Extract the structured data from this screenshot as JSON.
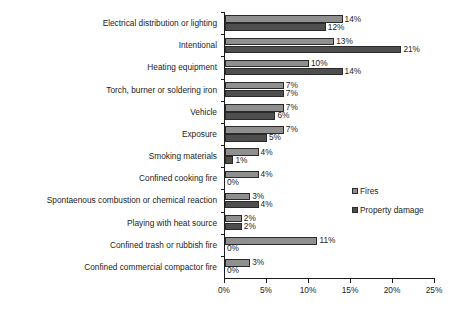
{
  "chart_data": {
    "type": "bar",
    "orientation": "horizontal",
    "title": "",
    "xlabel": "",
    "ylabel": "",
    "xlim": [
      0,
      25
    ],
    "xtick_labels": [
      "0%",
      "5%",
      "10%",
      "15%",
      "20%",
      "25%"
    ],
    "xticks": [
      0,
      5,
      10,
      15,
      20,
      25
    ],
    "grid": false,
    "legend_position": "right-middle",
    "categories": [
      "Electrical distribution or lighting",
      "Intentional",
      "Heating equipment",
      "Torch, burner or soldering iron",
      "Vehicle",
      "Exposure",
      "Smoking materials",
      "Confined cooking fire",
      "Spontaenous combustion or chemical reaction",
      "Playing with heat source",
      "Confined trash or rubbish fire",
      "Confined commercial compactor fire"
    ],
    "series": [
      {
        "name": "Fires",
        "color": "#8f8f8f",
        "values": [
          14,
          13,
          10,
          7,
          7,
          7,
          4,
          4,
          3,
          2,
          11,
          3
        ],
        "labels": [
          "14%",
          "13%",
          "10%",
          "7%",
          "7%",
          "7%",
          "4%",
          "4%",
          "3%",
          "2%",
          "11%",
          "3%"
        ]
      },
      {
        "name": "Property damage",
        "color": "#4e4e4e",
        "values": [
          12,
          21,
          14,
          7,
          6,
          5,
          1,
          0,
          4,
          2,
          0,
          0
        ],
        "labels": [
          "12%",
          "21%",
          "14%",
          "7%",
          "6%",
          "5%",
          "1%",
          "0%",
          "4%",
          "2%",
          "0%",
          "0%"
        ]
      }
    ]
  },
  "legend": {
    "items": [
      {
        "label": "Fires",
        "swatch": "legend-swatch-fires"
      },
      {
        "label": "Property damage",
        "swatch": "legend-swatch-property-damage"
      }
    ]
  }
}
